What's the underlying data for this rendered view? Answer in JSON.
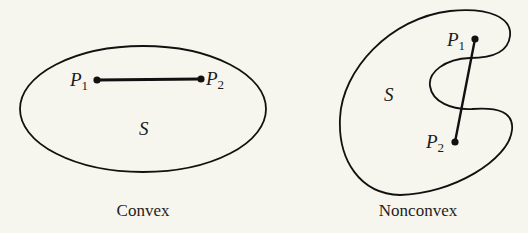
{
  "figure": {
    "background": "#f7f6ee",
    "ink": "#111111",
    "panels": [
      {
        "id": "convex",
        "caption": "Convex",
        "region_label": "S",
        "points": [
          {
            "name": "P",
            "sub": "1"
          },
          {
            "name": "P",
            "sub": "2"
          }
        ]
      },
      {
        "id": "nonconvex",
        "caption": "Nonconvex",
        "region_label": "S",
        "points": [
          {
            "name": "P",
            "sub": "1"
          },
          {
            "name": "P",
            "sub": "2"
          }
        ]
      }
    ]
  }
}
